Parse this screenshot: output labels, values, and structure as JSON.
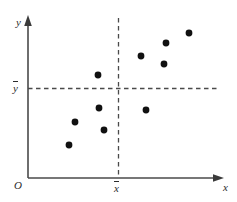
{
  "chart_data": {
    "type": "scatter",
    "title": "",
    "xlabel": "x",
    "ylabel": "y",
    "origin_label": "O",
    "grid": false,
    "legend": null,
    "xlim": [
      0,
      100
    ],
    "ylim": [
      0,
      100
    ],
    "axis_arrows": true,
    "reference_lines": [
      {
        "name": "x-mean",
        "orientation": "vertical",
        "label": "x̄",
        "label_base": "x",
        "value": 50,
        "style": "dashed"
      },
      {
        "name": "y-mean",
        "orientation": "horizontal",
        "label": "ȳ",
        "label_base": "y",
        "value": 56,
        "style": "dashed"
      }
    ],
    "points": [
      {
        "name": "p1",
        "x": 23,
        "y": 21,
        "quadrant": "lower-left"
      },
      {
        "name": "p2",
        "x": 27,
        "y": 35,
        "quadrant": "lower-left"
      },
      {
        "name": "p3",
        "x": 40,
        "y": 29,
        "quadrant": "lower-left"
      },
      {
        "name": "p4",
        "x": 37,
        "y": 44,
        "quadrant": "lower-left"
      },
      {
        "name": "p5",
        "x": 36,
        "y": 65,
        "quadrant": "upper-left"
      },
      {
        "name": "p6",
        "x": 58,
        "y": 43,
        "quadrant": "lower-right"
      },
      {
        "name": "p7",
        "x": 58,
        "y": 77,
        "quadrant": "upper-right"
      },
      {
        "name": "p8",
        "x": 70,
        "y": 72,
        "quadrant": "upper-right"
      },
      {
        "name": "p9",
        "x": 71,
        "y": 85,
        "quadrant": "upper-right"
      },
      {
        "name": "p10",
        "x": 83,
        "y": 91,
        "quadrant": "upper-right"
      }
    ],
    "point_count": 10,
    "point_color": "#111111",
    "axis_color": "#4a4a4a",
    "dash_color": "#4a4a4a"
  },
  "geometry": {
    "axis_x_left": 28,
    "axis_x_right": 222,
    "axis_y_top": 18,
    "axis_y_bottom": 178,
    "xbar_px": 118,
    "ybar_px": 88,
    "dash_h_right": 218,
    "point_radius": 3.4,
    "pixel_points": [
      {
        "cx": 69,
        "cy": 145
      },
      {
        "cx": 75,
        "cy": 122
      },
      {
        "cx": 104,
        "cy": 130
      },
      {
        "cx": 99,
        "cy": 108
      },
      {
        "cx": 98,
        "cy": 75
      },
      {
        "cx": 146,
        "cy": 110
      },
      {
        "cx": 141,
        "cy": 56
      },
      {
        "cx": 164,
        "cy": 64
      },
      {
        "cx": 166,
        "cy": 43
      },
      {
        "cx": 189,
        "cy": 33
      }
    ]
  }
}
